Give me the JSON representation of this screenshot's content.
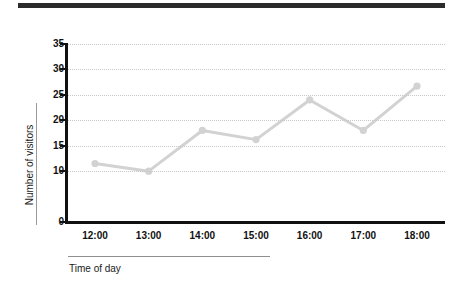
{
  "top_bar": {
    "present": true,
    "color": "#2b2b2b"
  },
  "chart_data": {
    "type": "line",
    "title": "",
    "subtitle": "",
    "xlabel": "Time of day",
    "ylabel": "Number of visitors",
    "categories": [
      "12:00",
      "13:00",
      "14:00",
      "15:00",
      "16:00",
      "17:00",
      "18:00"
    ],
    "values": [
      11.5,
      10,
      18,
      16.2,
      24,
      18,
      26.7
    ],
    "series": [
      {
        "name": "Number of visitors",
        "values": [
          11.5,
          10,
          18,
          16.2,
          24,
          18,
          26.7
        ],
        "color": "#d2d2d2",
        "marker": "circle"
      }
    ],
    "ylim": [
      0,
      35
    ],
    "ytick_labels": [
      "35",
      "30",
      "25",
      "20",
      "15",
      "10",
      "0"
    ],
    "ytick_values": [
      35,
      30,
      25,
      20,
      15,
      10,
      0
    ],
    "xtick_labels": [
      "12:00",
      "13:00",
      "14:00",
      "15:00",
      "16:00",
      "17:00",
      "18:00"
    ],
    "grid": "horizontal-dotted",
    "grid_color": "#c8c8c8",
    "axis_color": "#111111",
    "legend": "none",
    "legend_position": "none",
    "annotations": []
  }
}
